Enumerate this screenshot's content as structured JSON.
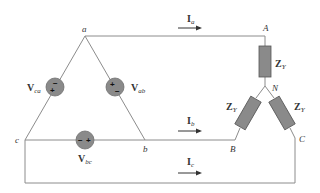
{
  "diagram": {
    "type": "delta-wye three-phase circuit",
    "nodes": {
      "a": "a",
      "b": "b",
      "c": "c",
      "A": "A",
      "B": "B",
      "C": "C",
      "N": "N"
    },
    "sources": [
      {
        "id": "Vab",
        "main": "V",
        "sub": "ab",
        "polarity_top": "+",
        "polarity_bottom": "−"
      },
      {
        "id": "Vca",
        "main": "V",
        "sub": "ca",
        "polarity_top": "−",
        "polarity_bottom": "+"
      },
      {
        "id": "Vbc",
        "main": "V",
        "sub": "bc",
        "polarity_left": "−",
        "polarity_right": "+"
      }
    ],
    "currents": [
      {
        "id": "Ia",
        "main": "I",
        "sub": "a"
      },
      {
        "id": "Ib",
        "main": "I",
        "sub": "b"
      },
      {
        "id": "Ic",
        "main": "I",
        "sub": "c"
      }
    ],
    "impedances": [
      {
        "id": "ZA",
        "main": "Z",
        "sub": "Y"
      },
      {
        "id": "ZB",
        "main": "Z",
        "sub": "Y"
      },
      {
        "id": "ZC",
        "main": "Z",
        "sub": "Y"
      }
    ],
    "colors": {
      "wire": "#8c8c8c",
      "element_fill": "#8a8a8a",
      "text": "#333333"
    }
  }
}
